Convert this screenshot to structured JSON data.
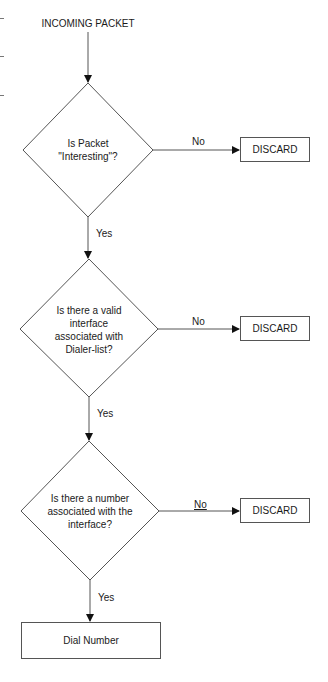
{
  "diagram": {
    "type": "flowchart",
    "start": {
      "label": "INCOMING PACKET"
    },
    "decisions": [
      {
        "id": "d1",
        "label": "Is Packet \"Interesting\"?",
        "lines": [
          "Is Packet",
          "\"Interesting\"?"
        ],
        "yes_label": "Yes",
        "no_label": "No",
        "no_target": "DISCARD"
      },
      {
        "id": "d2",
        "label": "Is there a valid interface associated with Dialer-list?",
        "lines": [
          "Is there a valid",
          "interface",
          "associated with",
          "Dialer-list?"
        ],
        "yes_label": "Yes",
        "no_label": "No",
        "no_target": "DISCARD"
      },
      {
        "id": "d3",
        "label": "Is there a number associated with the interface?",
        "lines": [
          "Is there a number",
          "associated with the",
          "interface?"
        ],
        "yes_label": "Yes",
        "no_label": "No",
        "no_target": "DISCARD"
      }
    ],
    "terminals": [
      {
        "id": "discard1",
        "label": "DISCARD"
      },
      {
        "id": "discard2",
        "label": "DISCARD"
      },
      {
        "id": "discard3",
        "label": "DISCARD"
      },
      {
        "id": "dial",
        "label": "Dial Number"
      }
    ],
    "colors": {
      "line": "#555555",
      "arrowhead": "#111111",
      "text": "#1a1a1a",
      "background": "#ffffff"
    }
  }
}
